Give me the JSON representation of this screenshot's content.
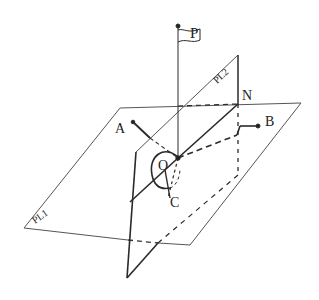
{
  "diagram": {
    "type": "geometry-3d-planes",
    "colors": {
      "line": "#2a2a2a",
      "thin_line": "#555555",
      "background": "#ffffff"
    },
    "labels": {
      "P": "P",
      "PL2": "PL2",
      "N": "N",
      "A": "A",
      "B": "B",
      "O": "O",
      "C": "C",
      "PL1": "PL1"
    },
    "planes": [
      {
        "name": "PL1",
        "role": "horizontal plane"
      },
      {
        "name": "PL2",
        "role": "inclined plane"
      }
    ],
    "points": [
      "P",
      "N",
      "A",
      "B",
      "O",
      "C"
    ]
  }
}
